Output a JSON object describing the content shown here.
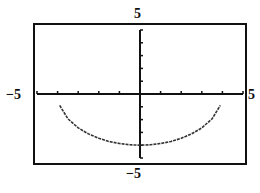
{
  "chart_data": {
    "type": "line",
    "title": "",
    "xlabel": "",
    "ylabel": "",
    "xlim": [
      -5,
      5
    ],
    "ylim": [
      -5,
      5
    ],
    "grid": false,
    "tick_labels": {
      "xmin": "−5",
      "xmax": "5",
      "ymin": "−5",
      "ymax": "5"
    },
    "series": [
      {
        "name": "y = -sqrt(16 - x^2)",
        "x": [
          -3.9,
          -3.5,
          -3,
          -2.5,
          -2,
          -1.5,
          -1,
          -0.5,
          0,
          0.5,
          1,
          1.5,
          2,
          2.5,
          3,
          3.5,
          3.9
        ],
        "y": [
          -0.89,
          -1.94,
          -2.65,
          -3.12,
          -3.46,
          -3.71,
          -3.87,
          -3.97,
          -4,
          -3.97,
          -3.87,
          -3.71,
          -3.46,
          -3.12,
          -2.65,
          -1.94,
          -0.89
        ]
      }
    ]
  }
}
